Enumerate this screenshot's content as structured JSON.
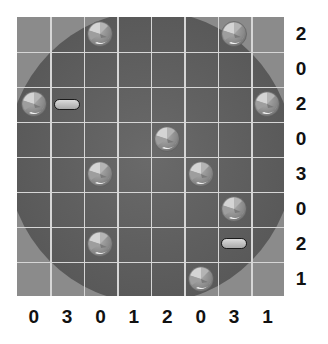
{
  "puzzle": {
    "grid_size": 8,
    "colors": {
      "board_outer": "#8b8b8b",
      "board_disc": "#5f5f5f",
      "grid_lines": "#d6d6d6",
      "clue_text": "#111111"
    },
    "row_clues": [
      "2",
      "0",
      "2",
      "0",
      "3",
      "0",
      "2",
      "1"
    ],
    "col_clues": [
      "0",
      "3",
      "0",
      "1",
      "2",
      "0",
      "3",
      "1"
    ],
    "pieces": [
      {
        "type": "ball",
        "row": 0,
        "col": 2
      },
      {
        "type": "ball",
        "row": 0,
        "col": 6
      },
      {
        "type": "ball",
        "row": 2,
        "col": 0
      },
      {
        "type": "pill",
        "row": 2,
        "col": 1
      },
      {
        "type": "ball",
        "row": 2,
        "col": 7
      },
      {
        "type": "ball",
        "row": 3,
        "col": 4
      },
      {
        "type": "ball",
        "row": 4,
        "col": 2
      },
      {
        "type": "ball",
        "row": 4,
        "col": 5
      },
      {
        "type": "ball",
        "row": 5,
        "col": 6
      },
      {
        "type": "ball",
        "row": 6,
        "col": 2
      },
      {
        "type": "pill",
        "row": 6,
        "col": 6
      },
      {
        "type": "ball",
        "row": 7,
        "col": 5
      }
    ]
  }
}
